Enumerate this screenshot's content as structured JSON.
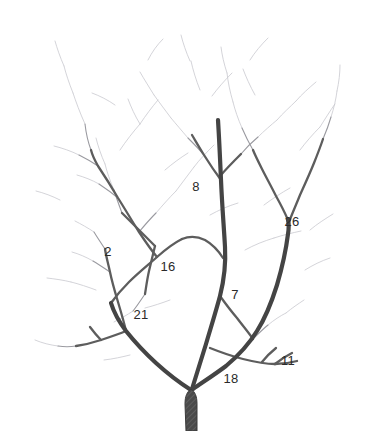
{
  "figure": {
    "kind": "branching-tree-illustration",
    "background_color": "#ffffff",
    "width": 375,
    "height": 431,
    "ink_color_dark": "#3a3a3a",
    "ink_color_mid": "#6a6a6a",
    "ink_color_faint": "#c9c9cf",
    "trunk_fill_color": "#4a4a4a",
    "label_color": "#2a2a2a"
  },
  "labels": [
    {
      "id": "label-2",
      "text": "2",
      "x": 108,
      "y": 251
    },
    {
      "id": "label-8",
      "text": "8",
      "x": 196,
      "y": 186
    },
    {
      "id": "label-26",
      "text": "26",
      "x": 292,
      "y": 221
    },
    {
      "id": "label-16",
      "text": "16",
      "x": 168,
      "y": 266
    },
    {
      "id": "label-21",
      "text": "21",
      "x": 141,
      "y": 314
    },
    {
      "id": "label-7",
      "text": "7",
      "x": 235,
      "y": 294
    },
    {
      "id": "label-18",
      "text": "18",
      "x": 231,
      "y": 378
    },
    {
      "id": "label-11",
      "text": "11",
      "x": 288,
      "y": 360
    }
  ],
  "branches": {
    "trunk": "M 186 431 L 185 404 C 185 396 187 392 191 389 C 195 392 197 396 197 404 L 197 431 Z",
    "primary": [
      {
        "id": "branch-left-main",
        "d": "M 191 390 C 180 383 168 374 156 363 C 144 352 134 341 126 331 C 120 323 114 313 111 303"
      },
      {
        "id": "branch-center-main",
        "d": "M 192 389 C 196 376 201 360 206 344 C 211 327 216 311 220 296 C 224 280 226 264 225 247 C 224 228 222 205 221 180 C 220 157 219 136 218 120"
      },
      {
        "id": "branch-right-main",
        "d": "M 193 389 C 203 382 214 375 226 366 C 238 356 249 344 257 331 C 266 317 272 301 277 285 C 282 268 286 250 288 234 C 289 228 289 224 288 220"
      }
    ],
    "secondary": [
      {
        "id": "branch-16-upper",
        "d": "M 111 303 C 116 296 122 289 129 282 C 138 273 148 265 157 257 C 166 249 174 243 182 239"
      },
      {
        "id": "branch-16-to-crossing",
        "d": "M 182 239 C 189 236 197 236 205 240 C 212 244 218 250 223 258"
      },
      {
        "id": "branch-2-stem",
        "d": "M 126 331 C 124 322 121 312 118 302 C 115 292 112 282 110 272 C 108 263 106 256 105 249"
      },
      {
        "id": "branch-21-left",
        "d": "M 126 331 C 119 334 110 337 101 340 C 92 343 83 345 76 346"
      },
      {
        "id": "branch-21-left-twig",
        "d": "M 101 340 C 97 336 93 331 90 327"
      },
      {
        "id": "branch-16-left-long",
        "d": "M 157 257 C 151 250 145 241 139 232 C 132 221 125 209 118 198 C 111 186 104 175 98 166 C 94 159 92 154 91 150"
      },
      {
        "id": "branch-16-crossing-up",
        "d": "M 155 246 C 149 240 143 234 137 228 C 131 222 126 217 122 213"
      },
      {
        "id": "branch-16-crossing-down",
        "d": "M 155 246 C 153 254 151 263 149 271 C 147 280 146 288 145 294"
      },
      {
        "id": "branch-7-split",
        "d": "M 220 296 C 225 303 231 311 237 318 C 243 326 249 333 253 339"
      },
      {
        "id": "branch-18-right",
        "d": "M 210 348 C 220 352 231 356 243 359 C 255 362 266 364 275 364"
      },
      {
        "id": "branch-11-twig-a",
        "d": "M 262 362 C 266 357 271 352 276 348"
      },
      {
        "id": "branch-11-twig-b",
        "d": "M 275 364 C 280 360 286 356 292 353"
      },
      {
        "id": "branch-11-twig-c",
        "d": "M 275 364 C 282 364 290 363 297 361"
      },
      {
        "id": "branch-26-left",
        "d": "M 288 220 C 285 213 281 205 276 196 C 271 186 266 177 262 169 C 258 161 255 155 253 150"
      },
      {
        "id": "branch-26-right",
        "d": "M 289 222 C 292 214 296 205 300 195 C 305 184 310 173 314 163 C 318 153 321 145 323 139"
      },
      {
        "id": "branch-8-upper-left",
        "d": "M 221 180 C 215 172 209 163 204 155 C 199 147 195 140 192 135"
      },
      {
        "id": "branch-8-upper-right",
        "d": "M 221 175 C 227 168 234 161 241 154"
      }
    ],
    "fine_twigs": [
      "M 91 150 C 88 142 86 133 85 124",
      "M 98 166 C 92 162 85 158 79 155",
      "M 105 249 C 101 243 97 237 94 232",
      "M 110 272 C 104 268 98 264 93 261",
      "M 118 198 C 112 193 105 188 99 184",
      "M 139 232 C 144 226 150 219 156 213",
      "M 122 213 C 119 205 116 197 114 190",
      "M 145 294 C 141 300 137 306 133 311",
      "M 76 346 C 70 347 64 347 58 346",
      "M 253 339 C 258 334 263 329 268 325",
      "M 204 155 C 199 149 193 143 188 138",
      "M 241 154 C 246 148 252 142 258 137",
      "M 253 150 C 249 143 245 135 242 128",
      "M 323 139 C 326 132 329 124 331 117"
    ],
    "faint_twigs": [
      "M 85 124 C 80 113 76 102 73 93",
      "M 79 155 C 71 151 62 148 54 146",
      "M 94 232 C 88 228 81 224 75 221",
      "M 93 261 C 86 257 79 254 72 252",
      "M 99 184 C 92 180 84 177 77 175",
      "M 156 213 C 162 206 169 198 176 191",
      "M 114 190 C 110 181 107 172 105 164",
      "M 133 311 C 127 315 120 319 114 322",
      "M 58 346 C 50 345 42 343 35 340",
      "M 268 325 C 274 320 280 316 286 313",
      "M 188 138 C 182 131 176 124 171 118",
      "M 258 137 C 264 131 271 125 277 120",
      "M 242 128 C 238 119 235 110 233 102",
      "M 331 117 C 334 108 336 99 337 91",
      "M 73 93 C 69 83 66 74 64 66",
      "M 176 191 C 182 183 188 175 194 167",
      "M 105 164 C 101 155 98 146 96 138",
      "M 286 313 C 292 308 298 304 304 300",
      "M 171 118 C 165 110 159 102 154 95",
      "M 277 120 C 283 113 290 107 296 101",
      "M 233 102 C 230 92 228 82 227 73",
      "M 337 91 C 339 82 340 73 340 65",
      "M 120 150 C 126 141 133 132 140 124",
      "M 140 124 C 146 115 152 107 158 100",
      "M 60 200 C 52 196 44 193 36 191",
      "M 140 124 C 135 116 131 107 128 99",
      "M 200 90 C 196 80 193 70 191 61",
      "M 212 96 C 218 88 225 80 232 73",
      "M 255 95 C 250 86 246 77 243 69",
      "M 300 150 C 306 142 313 134 320 127",
      "M 264 205 C 272 199 281 193 290 188",
      "M 245 250 C 254 245 264 241 274 238",
      "M 170 300 C 162 303 153 306 145 308",
      "M 96 290 C 88 287 79 284 71 282",
      "M 310 230 C 317 224 325 219 333 214",
      "M 250 60 C 255 52 261 45 268 38",
      "M 148 60 C 152 52 157 45 163 39",
      "M 305 270 C 313 265 321 261 330 258",
      "M 190 61 C 186 52 183 43 181 35",
      "M 227 73 C 224 64 222 55 221 47",
      "M 115 105 C 108 100 100 96 92 93",
      "M 165 170 C 172 164 180 158 188 153",
      "M 210 215 C 219 210 228 206 238 203",
      "M 130 355 C 122 357 113 359 104 360",
      "M 296 101 C 302 94 309 88 316 82",
      "M 64 66 C 60 57 57 48 55 41",
      "M 154 95 C 149 87 144 79 140 72",
      "M 194 167 C 200 159 207 152 214 145",
      "M 320 127 C 325 119 330 111 335 104",
      "M 274 238 C 283 235 292 233 301 231",
      "M 71 282 C 63 280 55 279 47 278"
    ]
  }
}
